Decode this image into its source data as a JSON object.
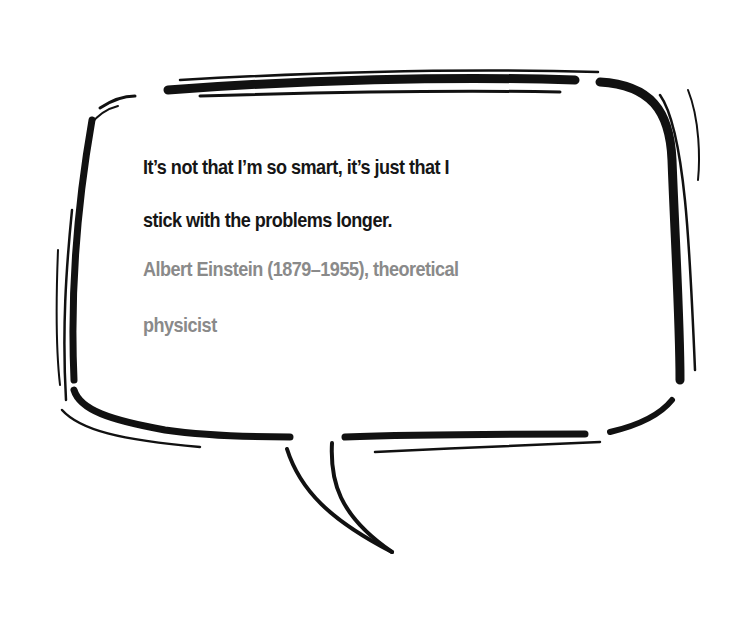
{
  "quote": {
    "line1": "It’s not that I’m so smart, it’s just that I",
    "line2": "stick with the problems longer.",
    "full_text": "It’s not that I’m so smart, it’s just that I stick with the problems longer."
  },
  "attribution": {
    "line1": "Albert Einstein (1879–1955), theoretical",
    "line2": "physicist"
  },
  "colors": {
    "quote_text": "#161616",
    "attribution_text": "#8a8a8a",
    "outline": "#111111",
    "background": "#ffffff"
  },
  "graphic": {
    "type": "hand-drawn speech bubble",
    "icon": "speech-bubble-icon"
  }
}
